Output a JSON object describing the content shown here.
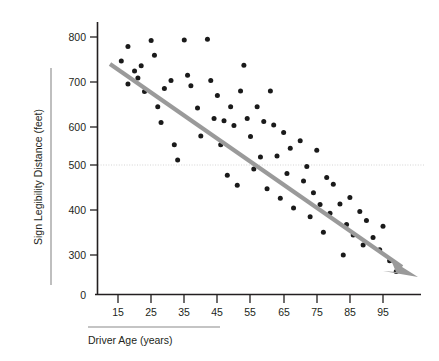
{
  "chart_data": {
    "type": "scatter",
    "title": "",
    "xlabel": "Driver Age (years)",
    "ylabel": "Sign Legibility Distance (feet)",
    "xlim": [
      10,
      102
    ],
    "ylim": [
      230,
      820
    ],
    "xticks": [
      15,
      25,
      35,
      45,
      55,
      65,
      75,
      85,
      95
    ],
    "yticks": [
      300,
      400,
      500,
      600,
      700,
      800
    ],
    "y_origin_label": "0",
    "grid": "single horizontal dotted gridline at y = 500",
    "gridline_value": 500,
    "legend": "none",
    "series": [
      {
        "name": "Drivers",
        "marker": "filled circle",
        "color": "#1a1a1a",
        "points": [
          [
            16,
            745
          ],
          [
            18,
            778
          ],
          [
            18,
            692
          ],
          [
            20,
            722
          ],
          [
            21,
            706
          ],
          [
            22,
            734
          ],
          [
            23,
            675
          ],
          [
            25,
            792
          ],
          [
            26,
            758
          ],
          [
            27,
            640
          ],
          [
            28,
            604
          ],
          [
            29,
            682
          ],
          [
            31,
            700
          ],
          [
            32,
            553
          ],
          [
            33,
            518
          ],
          [
            35,
            793
          ],
          [
            36,
            712
          ],
          [
            37,
            688
          ],
          [
            39,
            637
          ],
          [
            40,
            573
          ],
          [
            42,
            795
          ],
          [
            43,
            700
          ],
          [
            44,
            613
          ],
          [
            45,
            666
          ],
          [
            46,
            553
          ],
          [
            47,
            608
          ],
          [
            48,
            483
          ],
          [
            49,
            640
          ],
          [
            50,
            597
          ],
          [
            51,
            460
          ],
          [
            52,
            676
          ],
          [
            53,
            735
          ],
          [
            54,
            613
          ],
          [
            55,
            572
          ],
          [
            56,
            497
          ],
          [
            57,
            640
          ],
          [
            58,
            525
          ],
          [
            59,
            606
          ],
          [
            60,
            452
          ],
          [
            61,
            676
          ],
          [
            62,
            598
          ],
          [
            63,
            527
          ],
          [
            64,
            430
          ],
          [
            65,
            581
          ],
          [
            66,
            487
          ],
          [
            67,
            545
          ],
          [
            68,
            408
          ],
          [
            70,
            562
          ],
          [
            71,
            470
          ],
          [
            72,
            503
          ],
          [
            73,
            388
          ],
          [
            74,
            443
          ],
          [
            75,
            540
          ],
          [
            76,
            416
          ],
          [
            77,
            352
          ],
          [
            78,
            478
          ],
          [
            79,
            396
          ],
          [
            80,
            462
          ],
          [
            82,
            417
          ],
          [
            83,
            300
          ],
          [
            84,
            370
          ],
          [
            85,
            432
          ],
          [
            86,
            346
          ],
          [
            88,
            400
          ],
          [
            89,
            323
          ],
          [
            90,
            379
          ],
          [
            92,
            340
          ],
          [
            94,
            312
          ],
          [
            95,
            366
          ],
          [
            97,
            287
          ],
          [
            99,
            262
          ]
        ]
      }
    ],
    "trendline": {
      "type": "linear fit with arrowhead",
      "color": "#9a9a9a",
      "start": [
        17,
        733
      ],
      "end": [
        100,
        258
      ],
      "has_arrowhead": true
    }
  },
  "axes": {
    "y_title": "Sign Legibility Distance (feet)",
    "x_title": "Driver Age (years)",
    "y_tick_labels": [
      "800",
      "700",
      "600",
      "500",
      "400",
      "300"
    ],
    "x_tick_labels": [
      "15",
      "25",
      "35",
      "45",
      "55",
      "65",
      "75",
      "85",
      "95"
    ],
    "origin_label": "0"
  }
}
